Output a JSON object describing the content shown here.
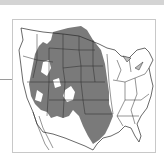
{
  "map": {
    "title": "Species range map — western and central United States",
    "region": "United States",
    "range_color": "#7a7a7a",
    "border_color": "#2a2a2a",
    "background_color": "#ffffff",
    "frame_color": "#c8c8c8",
    "legend": []
  }
}
